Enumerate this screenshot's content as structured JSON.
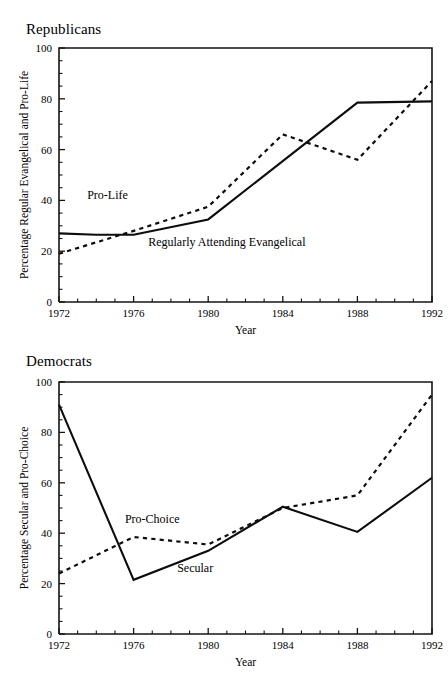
{
  "figure": {
    "background": "#ffffff",
    "ink_color": "#0d0d0d"
  },
  "panels": [
    {
      "id": "republicans",
      "title": "Republicans",
      "xlabel": "Year",
      "ylabel": "Percentage Regular Evangelical and Pro-Life",
      "xticks": [
        "1972",
        "1976",
        "1980",
        "1984",
        "1988",
        "1992"
      ],
      "yticks": [
        "0",
        "20",
        "40",
        "60",
        "80",
        "100"
      ],
      "annotations": [
        {
          "text": "Pro-Life",
          "x": 1974.6,
          "y": 40.5
        },
        {
          "text": "Regularly Attending Evangelical",
          "x": 1981.0,
          "y": 22.0
        }
      ]
    },
    {
      "id": "democrats",
      "title": "Democrats",
      "xlabel": "Year",
      "ylabel": "Percentage Secular and Pro-Choice",
      "xticks": [
        "1972",
        "1976",
        "1980",
        "1984",
        "1988",
        "1992"
      ],
      "yticks": [
        "0",
        "20",
        "40",
        "60",
        "80",
        "100"
      ],
      "annotations": [
        {
          "text": "Pro-Choice",
          "x": 1977.0,
          "y": 44.0
        },
        {
          "text": "Secular",
          "x": 1979.3,
          "y": 24.5
        }
      ]
    }
  ],
  "chart_data": [
    {
      "type": "line",
      "title": "Republicans",
      "xlabel": "Year",
      "ylabel": "Percentage Regular Evangelical and Pro-Life",
      "xlim": [
        1972,
        1992
      ],
      "ylim": [
        0,
        100
      ],
      "xticks": [
        1972,
        1976,
        1980,
        1984,
        1988,
        1992
      ],
      "yticks": [
        0,
        20,
        40,
        60,
        80,
        100
      ],
      "y_minor_tick_step": 5,
      "x_minor_tick_step": 1,
      "grid": false,
      "legend": "inline-annotations",
      "series": [
        {
          "name": "Regularly Attending Evangelical",
          "style": "solid",
          "x": [
            1972,
            1974,
            1976,
            1980,
            1988,
            1992
          ],
          "values": [
            27,
            26.5,
            26.5,
            32.5,
            78.5,
            79
          ]
        },
        {
          "name": "Pro-Life",
          "style": "dashed",
          "x": [
            1972,
            1976,
            1980,
            1984,
            1988,
            1992
          ],
          "values": [
            19,
            28,
            37.5,
            66,
            56,
            87
          ]
        }
      ]
    },
    {
      "type": "line",
      "title": "Democrats",
      "xlabel": "Year",
      "ylabel": "Percentage Secular and Pro-Choice",
      "xlim": [
        1972,
        1992
      ],
      "ylim": [
        0,
        100
      ],
      "xticks": [
        1972,
        1976,
        1980,
        1984,
        1988,
        1992
      ],
      "yticks": [
        0,
        20,
        40,
        60,
        80,
        100
      ],
      "y_minor_tick_step": 5,
      "x_minor_tick_step": 1,
      "grid": false,
      "legend": "inline-annotations",
      "series": [
        {
          "name": "Secular",
          "style": "solid",
          "x": [
            1972,
            1976,
            1980,
            1984,
            1988,
            1992
          ],
          "values": [
            91,
            21.5,
            33,
            50.5,
            40.5,
            62
          ]
        },
        {
          "name": "Pro-Choice",
          "style": "dashed",
          "x": [
            1972,
            1976,
            1980,
            1984,
            1988,
            1992
          ],
          "values": [
            24,
            38.5,
            35.5,
            50,
            55,
            95
          ]
        }
      ]
    }
  ]
}
